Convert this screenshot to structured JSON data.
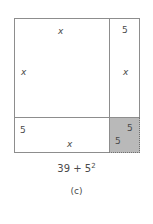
{
  "figure": {
    "label": "(c)",
    "expression_lead": "39 + 5",
    "expression_exponent": "2",
    "expression_full": "39 + 5^2",
    "colors": {
      "line": "#8d8d8d",
      "shaded_fill": "#b9b9b9",
      "dashed_edge": "#6f6f6f",
      "text": "#4a4a4a",
      "background": "#ffffff"
    },
    "regions": [
      {
        "name": "large-square",
        "position": "top-left",
        "shaded": false,
        "labels": [
          {
            "text": "x",
            "italic": true,
            "placement": "top-center"
          },
          {
            "text": "x",
            "italic": true,
            "placement": "left-middle"
          }
        ]
      },
      {
        "name": "right-strip",
        "position": "top-right",
        "shaded": false,
        "labels": [
          {
            "text": "5",
            "italic": false,
            "placement": "top-center"
          },
          {
            "text": "x",
            "italic": true,
            "placement": "middle-center"
          }
        ]
      },
      {
        "name": "bottom-strip",
        "position": "bottom-left",
        "shaded": false,
        "labels": [
          {
            "text": "5",
            "italic": false,
            "placement": "top-left"
          },
          {
            "text": "x",
            "italic": true,
            "placement": "bottom-center"
          }
        ]
      },
      {
        "name": "shaded-square",
        "position": "bottom-right",
        "shaded": true,
        "dashed_edges": [
          "right",
          "bottom"
        ],
        "labels": [
          {
            "text": "5",
            "italic": false,
            "placement": "top-right"
          },
          {
            "text": "5",
            "italic": false,
            "placement": "bottom-left"
          }
        ]
      }
    ]
  }
}
